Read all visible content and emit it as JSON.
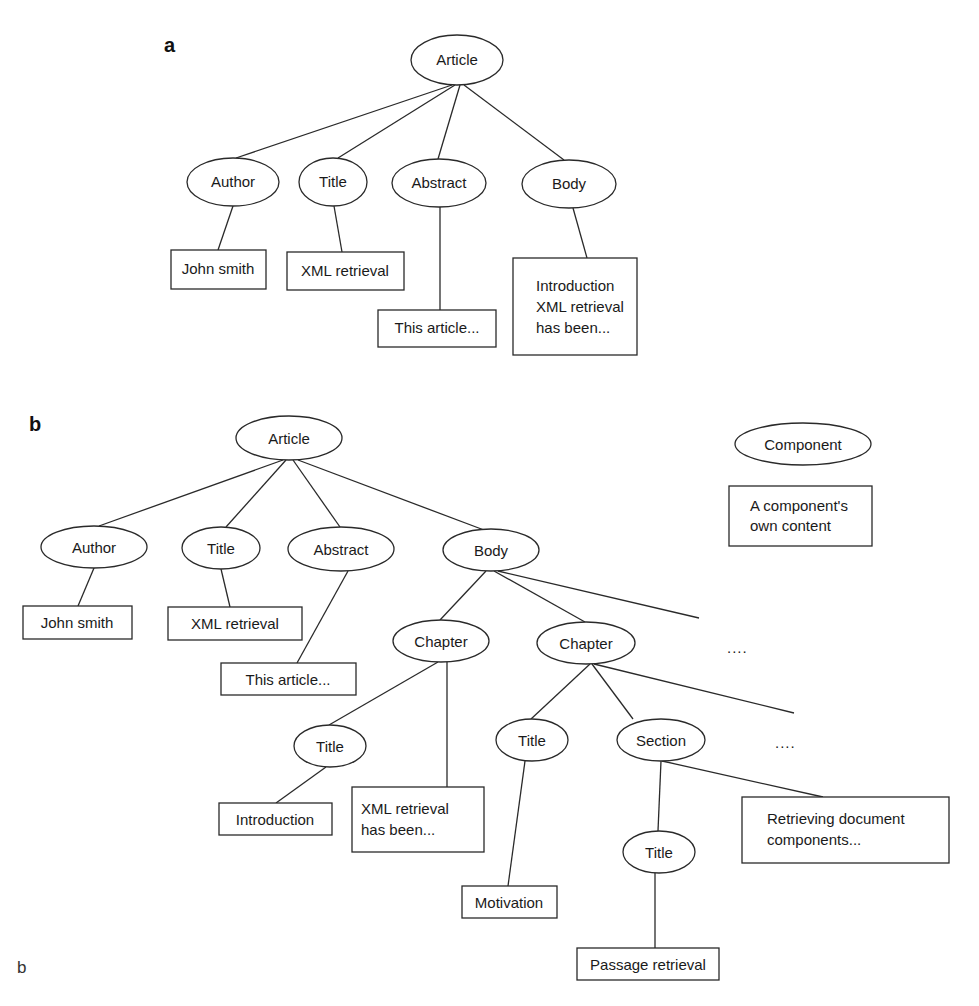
{
  "figure": {
    "panel_a": {
      "label": "a",
      "nodes": {
        "article": "Article",
        "author": "Author",
        "title": "Title",
        "abstract": "Abstract",
        "body": "Body"
      },
      "contents": {
        "author_content": [
          "John smith"
        ],
        "title_content": [
          "XML retrieval"
        ],
        "abstract_content": [
          "This article..."
        ],
        "body_content": [
          "Introduction",
          "XML retrieval",
          "has been..."
        ]
      }
    },
    "panel_b": {
      "label": "b",
      "nodes": {
        "article": "Article",
        "author": "Author",
        "title": "Title",
        "abstract": "Abstract",
        "body": "Body",
        "chapter1": "Chapter",
        "chapter2": "Chapter",
        "chapter1_title": "Title",
        "chapter2_title": "Title",
        "section": "Section",
        "section_title": "Title"
      },
      "contents": {
        "author_content": [
          "John smith"
        ],
        "title_content": [
          "XML retrieval"
        ],
        "abstract_content": [
          "This article..."
        ],
        "chapter1_title_content": [
          "Introduction"
        ],
        "chapter1_content": [
          "XML retrieval",
          "has been..."
        ],
        "chapter2_title_content": [
          "Motivation"
        ],
        "section_title_content": [
          "Passage retrieval"
        ],
        "section_content": [
          "Retrieving document",
          "components..."
        ]
      },
      "ellipsis": {
        "more_chapters": "....",
        "more_sections": "...."
      },
      "legend": {
        "component": "Component",
        "content": [
          "A component's",
          "own content"
        ]
      }
    },
    "stray_label": "b"
  }
}
